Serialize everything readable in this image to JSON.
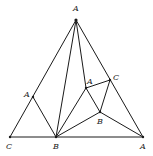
{
  "diagram": {
    "type": "graph",
    "vertices": [
      {
        "id": "top",
        "label": "A",
        "x": 76,
        "y": 20,
        "lx": 73,
        "ly": 11
      },
      {
        "id": "bottom-left",
        "label": "C",
        "x": 10,
        "y": 137,
        "lx": 6,
        "ly": 149
      },
      {
        "id": "bottom-mid",
        "label": "B",
        "x": 56,
        "y": 137,
        "lx": 53,
        "ly": 149
      },
      {
        "id": "bottom-right",
        "label": "A",
        "x": 143,
        "y": 137,
        "lx": 140,
        "ly": 149
      },
      {
        "id": "left",
        "label": "A",
        "x": 33,
        "y": 97,
        "lx": 24,
        "ly": 97
      },
      {
        "id": "inner-a",
        "label": "A",
        "x": 86,
        "y": 88,
        "lx": 87,
        "ly": 84
      },
      {
        "id": "inner-c",
        "label": "C",
        "x": 110,
        "y": 80,
        "lx": 113,
        "ly": 80
      },
      {
        "id": "inner-b",
        "label": "B",
        "x": 100,
        "y": 112,
        "lx": 97,
        "ly": 124
      }
    ],
    "edges": [
      [
        "top",
        "bottom-left"
      ],
      [
        "top",
        "bottom-right"
      ],
      [
        "bottom-left",
        "bottom-right"
      ],
      [
        "left",
        "bottom-mid"
      ],
      [
        "top",
        "bottom-mid"
      ],
      [
        "top",
        "inner-a"
      ],
      [
        "inner-a",
        "inner-c"
      ],
      [
        "inner-c",
        "inner-b"
      ],
      [
        "inner-a",
        "inner-b"
      ],
      [
        "inner-a",
        "bottom-mid"
      ],
      [
        "inner-b",
        "bottom-mid"
      ],
      [
        "inner-b",
        "bottom-right"
      ]
    ],
    "colors": {
      "stroke": "#1a1a1a",
      "background": "#ffffff"
    }
  }
}
